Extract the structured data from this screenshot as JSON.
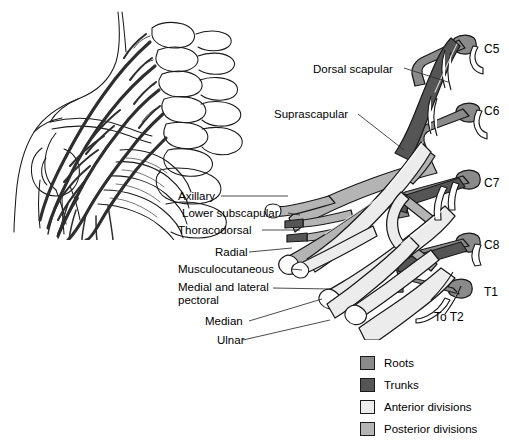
{
  "figure": {
    "background": "#ffffff"
  },
  "colors": {
    "roots": "#8a8a8a",
    "trunks": "#555555",
    "anterior_divisions": "#ececec",
    "posterior_divisions": "#b4b4b4",
    "outline": "#1a1a1a",
    "leader_line": "#2a2a2a"
  },
  "branch_labels": [
    {
      "id": "dorsal-scapular",
      "text": "Dorsal scapular",
      "x": 313,
      "y": 63,
      "align": "left"
    },
    {
      "id": "suprascapular",
      "text": "Suprascapular",
      "x": 274,
      "y": 108,
      "align": "left"
    },
    {
      "id": "axillary",
      "text": "Axillary",
      "x": 178,
      "y": 192,
      "align": "left"
    },
    {
      "id": "lower-subscapular",
      "text": "Lower subscapular",
      "x": 178,
      "y": 209,
      "align": "left"
    },
    {
      "id": "thoracodorsal",
      "text": "Thoracodorsal",
      "x": 178,
      "y": 226,
      "align": "left"
    },
    {
      "id": "radial",
      "text": "Radial",
      "x": 215,
      "y": 248,
      "align": "left"
    },
    {
      "id": "musculocutaneous",
      "text": "Musculocutaneous",
      "x": 178,
      "y": 265,
      "align": "left"
    },
    {
      "id": "medial-lateral-pectoral-1",
      "text": "Medial and lateral",
      "x": 178,
      "y": 283,
      "align": "left"
    },
    {
      "id": "medial-lateral-pectoral-2",
      "text": "pectoral",
      "x": 178,
      "y": 296,
      "align": "left"
    },
    {
      "id": "median",
      "text": "Median",
      "x": 205,
      "y": 318,
      "align": "left"
    },
    {
      "id": "ulnar",
      "text": "Ulnar",
      "x": 217,
      "y": 337,
      "align": "left"
    }
  ],
  "root_labels": [
    {
      "id": "c5",
      "text": "C5",
      "x": 484,
      "y": 42
    },
    {
      "id": "c6",
      "text": "C6",
      "x": 484,
      "y": 104
    },
    {
      "id": "c7",
      "text": "C7",
      "x": 484,
      "y": 176
    },
    {
      "id": "c8",
      "text": "C8",
      "x": 484,
      "y": 238
    },
    {
      "id": "t1",
      "text": "T1",
      "x": 484,
      "y": 285
    },
    {
      "id": "to-t2",
      "text": "To T2",
      "x": 434,
      "y": 312
    }
  ],
  "legend": {
    "items": [
      {
        "id": "roots",
        "label": "Roots",
        "color": "#8a8a8a"
      },
      {
        "id": "trunks",
        "label": "Trunks",
        "color": "#555555"
      },
      {
        "id": "anterior-divisions",
        "label": "Anterior divisions",
        "color": "#ececec"
      },
      {
        "id": "posterior-divisions",
        "label": "Posterior divisions",
        "color": "#b4b4b4"
      }
    ]
  }
}
